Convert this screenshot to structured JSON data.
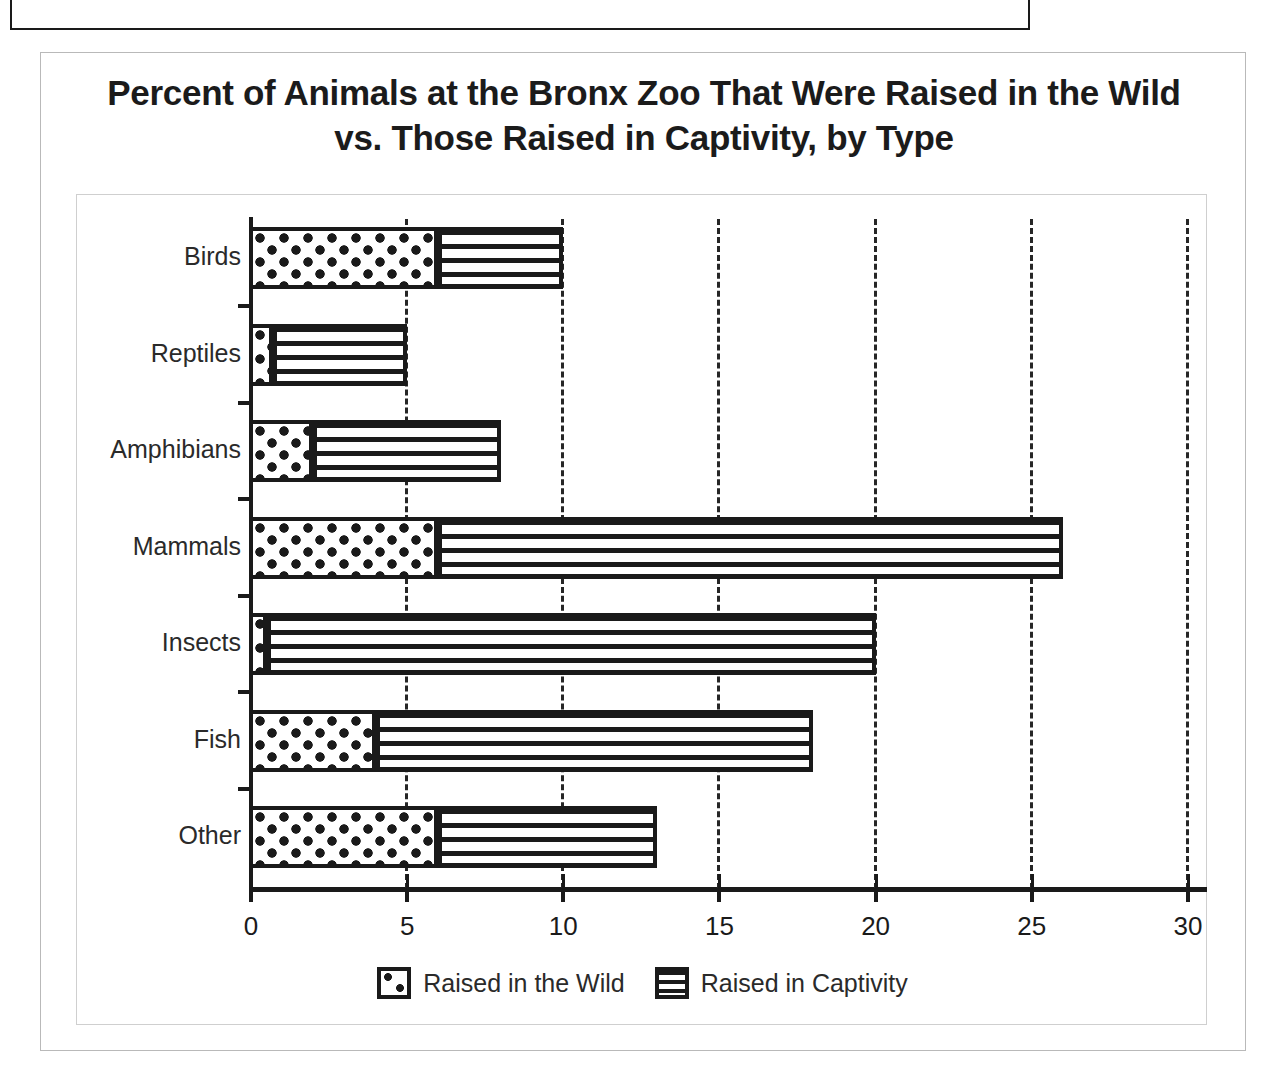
{
  "top_cut_box": {
    "partial_text": "Question 14 of 20 — refer to the graph below"
  },
  "figure": {
    "title": "Percent of Animals at the Bronx Zoo That Were Raised in the Wild vs. Those Raised in Captivity, by Type"
  },
  "legend": {
    "items": [
      {
        "label": "Raised in the Wild",
        "swatch": "dotted-pattern-swatch"
      },
      {
        "label": "Raised in Captivity",
        "swatch": "horizontal-lines-pattern-swatch"
      }
    ]
  },
  "chart_data": {
    "type": "bar",
    "orientation": "horizontal",
    "stacked": true,
    "title": "Percent of Animals at the Bronx Zoo That Were Raised in the Wild vs. Those Raised in Captivity, by Type",
    "xlabel": "",
    "ylabel": "",
    "categories": [
      "Birds",
      "Reptiles",
      "Amphibians",
      "Mammals",
      "Insects",
      "Fish",
      "Other"
    ],
    "series": [
      {
        "name": "Raised in the Wild",
        "pattern": "dots",
        "values": [
          6,
          0.7,
          2,
          6,
          0.5,
          4,
          6
        ]
      },
      {
        "name": "Raised in Captivity",
        "pattern": "horizontal-lines",
        "values": [
          4,
          4.3,
          6,
          20,
          19.5,
          14,
          7
        ]
      }
    ],
    "totals": [
      10,
      5,
      8,
      26,
      20,
      18,
      13
    ],
    "xlim": [
      0,
      30
    ],
    "xticks": [
      0,
      5,
      10,
      15,
      20,
      25,
      30
    ],
    "xtick_labels": [
      "0",
      "5",
      "10",
      "15",
      "20",
      "25",
      "30"
    ],
    "grid": "vertical-dashed-at-xticks",
    "legend_position": "bottom-center"
  }
}
